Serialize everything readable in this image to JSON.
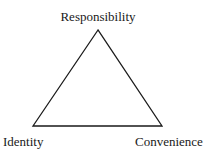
{
  "diagram": {
    "type": "triangle",
    "stroke_color": "#1a1a1a",
    "vertices": {
      "top": {
        "label": "Responsibility",
        "x": 98,
        "y": 30
      },
      "bottom_left": {
        "label": "Identity",
        "x": 33,
        "y": 126
      },
      "bottom_right": {
        "label": "Convenience",
        "x": 162,
        "y": 126
      }
    }
  }
}
